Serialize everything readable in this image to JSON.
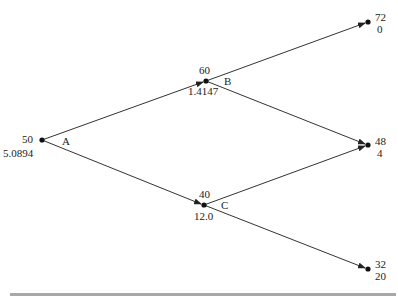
{
  "tree": {
    "nodes": {
      "A": {
        "name": "A",
        "price": "50",
        "value": "5.0894"
      },
      "B": {
        "name": "B",
        "price": "60",
        "value": "1.4147"
      },
      "C": {
        "name": "C",
        "price": "40",
        "value": "12.0"
      },
      "T1": {
        "price": "72",
        "value": "0"
      },
      "T2": {
        "price": "48",
        "value": "4"
      },
      "T3": {
        "price": "32",
        "value": "20"
      }
    }
  }
}
